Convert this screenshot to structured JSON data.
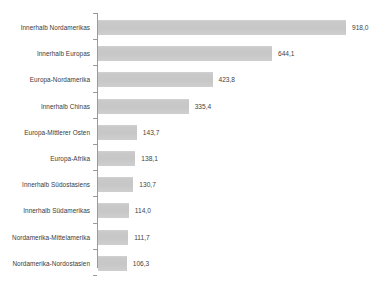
{
  "chart_data": {
    "type": "bar",
    "orientation": "horizontal",
    "title": "",
    "subtitle": "",
    "xlabel": "",
    "ylabel": "",
    "grid": false,
    "legend": null,
    "decimal_separator": ",",
    "xlim": [
      0,
      1000
    ],
    "axis_tick_labels": [],
    "categories": [
      "Innerhalb Nordamerikas",
      "Innerhalb Europas",
      "Europa-Nordamerika",
      "Innerhalb Chinas",
      "Europa-Mittlerer Osten",
      "Europa-Afrika",
      "Innerhalb Südostasiens",
      "Innerhalb Südamerikas",
      "Nordamerika-Mittelamerika",
      "Nordamerika-Nordostasien"
    ],
    "values": [
      918.0,
      644.1,
      423.8,
      335.4,
      143.7,
      138.1,
      130.7,
      114.0,
      111.7,
      106.3
    ],
    "value_labels": [
      "918,0",
      "644,1",
      "423,8",
      "335,4",
      "143,7",
      "138,1",
      "130,7",
      "114,0",
      "111,7",
      "106,3"
    ],
    "colors": {
      "bar": "#c9c9c9",
      "axis": "#9a9a9a",
      "label_text": "#3a3a3a",
      "value_text": "#3f3f3f",
      "background": "#ffffff"
    }
  }
}
